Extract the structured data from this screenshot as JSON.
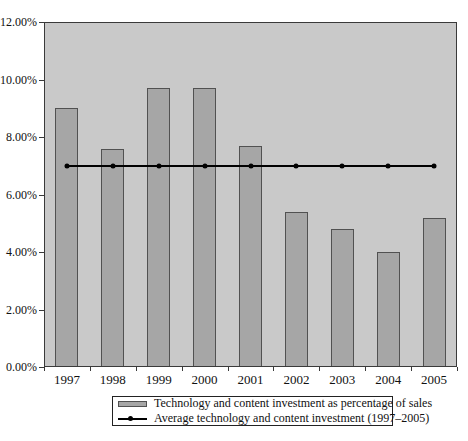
{
  "colors": {
    "plot_background": "#c9c9c9",
    "bar_fill": "#a6a6a6",
    "bar_border": "#515151",
    "line_color": "#000000",
    "axis_color": "#3a3a3a",
    "text_color": "#111111",
    "page_background": "#ffffff"
  },
  "layout": {
    "plot": {
      "left": 44,
      "top": 22,
      "width": 413,
      "height": 345
    },
    "bar_width": 23,
    "legend": {
      "left": 112,
      "top": 396,
      "width": 281,
      "height": 30
    }
  },
  "chart_data": {
    "type": "bar",
    "categories": [
      "1997",
      "1998",
      "1999",
      "2000",
      "2001",
      "2002",
      "2003",
      "2004",
      "2005"
    ],
    "series": [
      {
        "name": "Technology and content investment as percentage of sales",
        "type": "bar",
        "values": [
          9.0,
          7.6,
          9.7,
          9.7,
          7.7,
          5.4,
          4.8,
          4.0,
          5.2
        ]
      },
      {
        "name": "Average technology and content investment (1997–2005)",
        "type": "line",
        "values": [
          7.0,
          7.0,
          7.0,
          7.0,
          7.0,
          7.0,
          7.0,
          7.0,
          7.0
        ]
      }
    ],
    "title": "",
    "xlabel": "",
    "ylabel": "",
    "ylim": [
      0,
      12
    ],
    "y_tick_step": 2,
    "y_tick_labels": [
      "0.00%",
      "2.00%",
      "4.00%",
      "6.00%",
      "8.00%",
      "10.00%",
      "12.00%"
    ],
    "grid": false,
    "legend_position": "bottom"
  },
  "legend": {
    "items": [
      {
        "label": "Technology and content investment as percentage of sales",
        "marker": "bar-swatch"
      },
      {
        "label": "Average technology and content investment (1997–2005)",
        "marker": "line-dot-swatch"
      }
    ]
  }
}
